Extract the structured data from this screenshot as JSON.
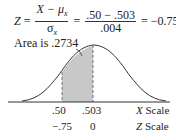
{
  "formula": {
    "lhs": "Z",
    "eq1": "=",
    "frac1_num": "X − μ",
    "frac1_num_sub": "x",
    "frac1_den": "σ",
    "frac1_den_sub": "x",
    "eq2": "=",
    "frac2_num": ".50 − .503",
    "frac2_den": ".004",
    "eq3": "=",
    "result": "−0.75"
  },
  "annotation": {
    "area_label": "Area is .2734"
  },
  "x_axis": {
    "ticks": [
      ".50",
      ".503"
    ],
    "scale_var": "X",
    "scale_word": "Scale"
  },
  "z_axis": {
    "ticks": [
      "−.75",
      "0"
    ],
    "scale_var": "Z",
    "scale_word": "Scale"
  },
  "colors": {
    "shade": "#c8c8c8",
    "line": "#333333"
  }
}
